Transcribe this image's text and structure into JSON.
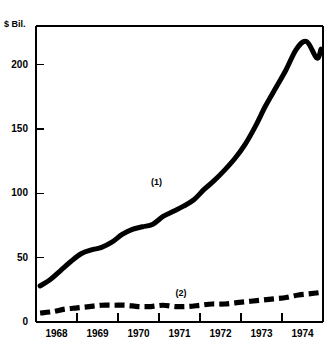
{
  "chart_data": {
    "type": "line",
    "title": "",
    "xlabel": "",
    "ylabel": "$ Bil.",
    "ylim": [
      0,
      230
    ],
    "xlim": [
      1968,
      1975
    ],
    "grid": false,
    "legend_position": "inline-annotations",
    "yticks": [
      0,
      50,
      100,
      150,
      200
    ],
    "ytick_labels": [
      "0",
      "50",
      "100",
      "150",
      "200"
    ],
    "xticks": [
      1968,
      1969,
      1970,
      1971,
      1972,
      1973,
      1974,
      1975
    ],
    "xtick_labels": [
      "1968",
      "1969",
      "1970",
      "1971",
      "1972",
      "1973",
      "1974"
    ],
    "annotations": [
      {
        "text": "(1)",
        "series": "series-1",
        "x": 1971.0,
        "y": 108
      },
      {
        "text": "(2)",
        "series": "series-2",
        "x": 1971.6,
        "y": 22
      }
    ],
    "series": [
      {
        "name": "(1)",
        "style": "solid",
        "color": "#000000",
        "x": [
          1968.1,
          1968.35,
          1968.6,
          1968.85,
          1969.1,
          1969.35,
          1969.6,
          1969.85,
          1970.1,
          1970.35,
          1970.6,
          1970.85,
          1971.1,
          1971.35,
          1971.6,
          1971.85,
          1972.1,
          1972.35,
          1972.6,
          1972.85,
          1973.1,
          1973.35,
          1973.6,
          1973.85,
          1974.1,
          1974.35,
          1974.6,
          1974.85,
          1974.95
        ],
        "y": [
          28,
          33,
          40,
          47,
          53,
          56,
          58,
          62,
          68,
          72,
          74,
          76,
          82,
          86,
          90,
          95,
          103,
          110,
          118,
          127,
          138,
          152,
          168,
          182,
          196,
          212,
          218,
          205,
          212
        ]
      },
      {
        "name": "(2)",
        "style": "dashed",
        "color": "#000000",
        "x": [
          1968.1,
          1968.4,
          1968.7,
          1969.0,
          1969.3,
          1969.6,
          1969.9,
          1970.2,
          1970.5,
          1970.8,
          1971.1,
          1971.4,
          1971.7,
          1972.0,
          1972.3,
          1972.6,
          1972.9,
          1973.2,
          1973.5,
          1973.8,
          1974.1,
          1974.4,
          1974.7,
          1974.95
        ],
        "y": [
          7,
          8,
          10,
          11,
          12,
          13,
          13,
          13,
          12,
          12,
          13,
          12,
          12,
          13,
          14,
          14,
          15,
          16,
          17,
          18,
          19,
          21,
          22,
          23
        ]
      }
    ]
  },
  "axis_unit_label": "$ Bil."
}
